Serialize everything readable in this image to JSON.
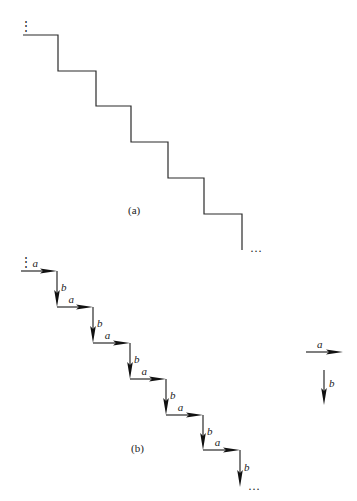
{
  "figure_a": {
    "caption": "(a)",
    "start": [
      23,
      35
    ],
    "steps": [
      {
        "x1": 23,
        "x2": 58,
        "y": 35
      },
      {
        "x1": 58,
        "x2": 96,
        "y": 71
      },
      {
        "x1": 96,
        "x2": 131,
        "y": 106
      },
      {
        "x1": 131,
        "x2": 168,
        "y": 142
      },
      {
        "x1": 168,
        "x2": 204,
        "y": 178
      },
      {
        "x1": 204,
        "x2": 242,
        "y": 214
      }
    ],
    "end_y": 250,
    "continuation_start": "⋮",
    "continuation_end": "…"
  },
  "figure_b": {
    "caption": "(b)",
    "horizontal_label": "a",
    "vertical_label": "b",
    "steps": [
      {
        "x1": 21,
        "x2": 57,
        "y": 271
      },
      {
        "x1": 57,
        "x2": 93,
        "y": 307
      },
      {
        "x1": 93,
        "x2": 130,
        "y": 343
      },
      {
        "x1": 130,
        "x2": 166,
        "y": 379
      },
      {
        "x1": 166,
        "x2": 203,
        "y": 415
      },
      {
        "x1": 203,
        "x2": 240,
        "y": 450
      }
    ],
    "end_y": 487,
    "continuation_start": "⋮",
    "continuation_end": "…"
  },
  "legend": {
    "a_label": "a",
    "b_label": "b",
    "a_arrow": {
      "x1": 306,
      "x2": 343,
      "y": 352
    },
    "b_arrow": {
      "x": 324,
      "y1": 370,
      "y2": 405
    }
  }
}
